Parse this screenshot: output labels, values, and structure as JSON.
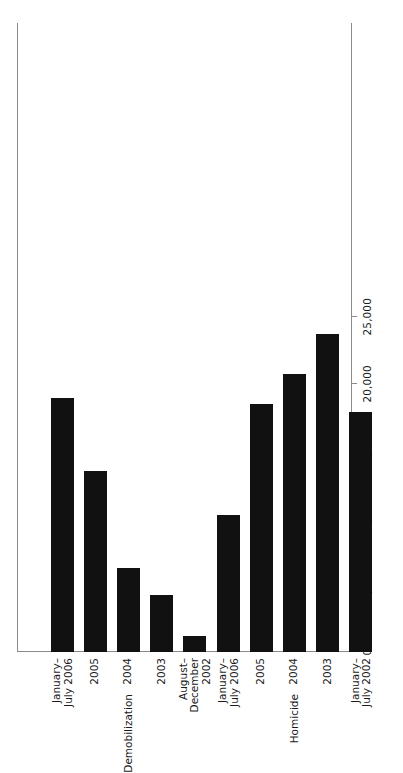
{
  "chart_data": {
    "type": "bar",
    "orientation": "horizontal",
    "title": "",
    "xlabel": "",
    "ylabel": "",
    "xlim": [
      0,
      25000
    ],
    "grid": false,
    "legend": "none",
    "tick_labels": [
      "25,000",
      "20,000",
      "15,000",
      "10,000",
      "5,000",
      "0"
    ],
    "tick_values": [
      25000,
      20000,
      15000,
      10000,
      5000,
      0
    ],
    "groups": [
      {
        "name": "Demobilization",
        "categories": [
          "January–\nJuly 2006",
          "2005",
          "2004",
          "2003",
          "August–\nDecember\n2002"
        ],
        "values": [
          18950,
          13500,
          6300,
          4250,
          1200
        ]
      },
      {
        "name": "Homicide",
        "categories": [
          "January–\nJuly 2006",
          "2005",
          "2004",
          "2003",
          "January–\nJuly 2002"
        ],
        "values": [
          10200,
          18500,
          20700,
          23700,
          17900
        ]
      }
    ],
    "bars": [
      {
        "group": "Demobilization",
        "category": "January–\nJuly 2006",
        "value": 18950
      },
      {
        "group": "Demobilization",
        "category": "2005",
        "value": 13500
      },
      {
        "group": "Demobilization",
        "category": "2004",
        "value": 6300
      },
      {
        "group": "Demobilization",
        "category": "2003",
        "value": 4250
      },
      {
        "group": "Demobilization",
        "category": "August–\nDecember\n2002",
        "value": 1200
      },
      {
        "group": "Homicide",
        "category": "January–\nJuly 2006",
        "value": 10200
      },
      {
        "group": "Homicide",
        "category": "2005",
        "value": 18500
      },
      {
        "group": "Homicide",
        "category": "2004",
        "value": 20700
      },
      {
        "group": "Homicide",
        "category": "2003",
        "value": 23700
      },
      {
        "group": "Homicide",
        "category": "January–\nJuly 2002",
        "value": 17900
      }
    ],
    "colors": {
      "bar": "#111111",
      "axis": "#8b8b8b",
      "text": "#1a1a1a",
      "background": "#ffffff"
    }
  },
  "axis": {
    "ticks": [
      {
        "label": "25,000",
        "value": 25000
      },
      {
        "label": "20,000",
        "value": 20000
      },
      {
        "label": "15,000",
        "value": 15000
      },
      {
        "label": "10,000",
        "value": 10000
      },
      {
        "label": "5,000",
        "value": 5000
      },
      {
        "label": "0",
        "value": 0
      }
    ]
  },
  "categories": [
    {
      "label": "January–\nJuly 2006",
      "group": "Demobilization"
    },
    {
      "label": "2005",
      "group": "Demobilization"
    },
    {
      "label": "2004",
      "group": "Demobilization"
    },
    {
      "label": "2003",
      "group": "Demobilization"
    },
    {
      "label": "August–\nDecember\n2002",
      "group": "Demobilization"
    },
    {
      "label": "January–\nJuly 2006",
      "group": "Homicide"
    },
    {
      "label": "2005",
      "group": "Homicide"
    },
    {
      "label": "2004",
      "group": "Homicide"
    },
    {
      "label": "2003",
      "group": "Homicide"
    },
    {
      "label": "January–\nJuly 2002",
      "group": "Homicide"
    }
  ],
  "group_labels": [
    "Demobilization",
    "Homicide"
  ]
}
